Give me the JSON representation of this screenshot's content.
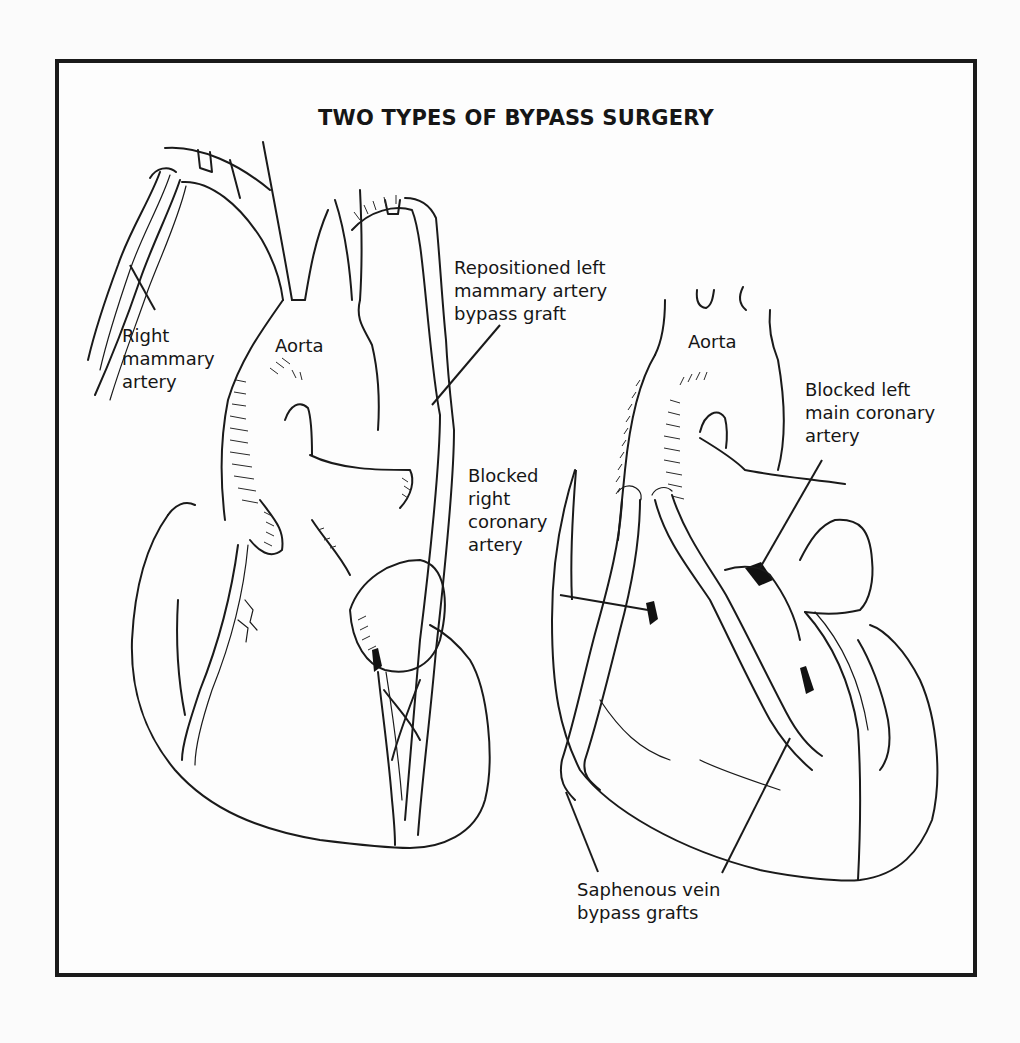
{
  "figure": {
    "title": "TWO TYPES OF BYPASS SURGERY",
    "colors": {
      "line": "#1a1a1a",
      "background": "#fdfdfd",
      "frame": "#1a1a1a"
    }
  },
  "left_panel": {
    "name": "Mammary artery bypass",
    "labels": {
      "right_mammary_artery": [
        "Right",
        "mammary",
        "artery"
      ],
      "aorta": "Aorta",
      "repositioned_graft": [
        "Repositioned left",
        "mammary artery",
        "bypass graft"
      ],
      "blocked_right_coronary": [
        "Blocked",
        "right",
        "coronary",
        "artery"
      ]
    }
  },
  "right_panel": {
    "name": "Saphenous vein bypass",
    "labels": {
      "aorta": "Aorta",
      "blocked_left_main": [
        "Blocked left",
        "main coronary",
        "artery"
      ],
      "saphenous_grafts": [
        "Saphenous vein",
        "bypass grafts"
      ]
    }
  }
}
